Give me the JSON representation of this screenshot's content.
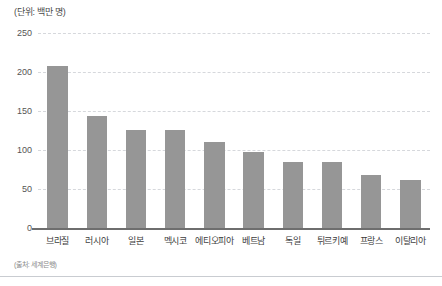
{
  "figure": {
    "unit_note": "(단위: 백만 명)",
    "source_note": "(출처: 세계은행)"
  },
  "style": {
    "bar_color": "#969696",
    "gridline_color": "#d6d8dc",
    "axis_color": "#6e6e6e",
    "rule_color": "#c9ccd1",
    "text_color": "#333333"
  },
  "chart_data": {
    "type": "bar",
    "title": "",
    "subtitle": "",
    "xlabel": "",
    "ylabel": "",
    "unit": "백만 명",
    "source": "세계은행",
    "categories": [
      "브라질",
      "러시아",
      "일본",
      "멕시코",
      "에티오피아",
      "베트남",
      "독일",
      "튀르키예",
      "프랑스",
      "이탈리아"
    ],
    "values": [
      208,
      144,
      126,
      126,
      110,
      97,
      84,
      84,
      68,
      62
    ],
    "ylim": [
      0,
      250
    ],
    "yticks": [
      0,
      50,
      100,
      150,
      200,
      250
    ],
    "ytick_labels": [
      "0",
      "50",
      "100",
      "150",
      "200",
      "250"
    ],
    "grid": true,
    "grid_axis": "y",
    "legend": false,
    "legend_position": "none"
  }
}
